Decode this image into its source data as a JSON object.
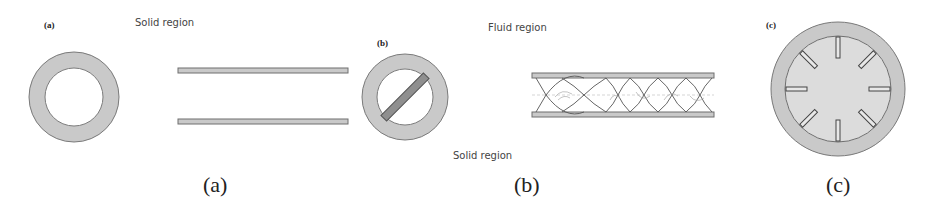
{
  "figure": {
    "colors": {
      "wall_fill": "#c9c9c9",
      "wall_stroke": "#7a7a7a",
      "tape_fill": "#8f8f8f",
      "fluid_fill_c": "#dcdcdc",
      "background": "#ffffff"
    },
    "panels": [
      {
        "id": "a",
        "tag": "(a)",
        "caption": "(a)",
        "region_label": "Solid region",
        "description": "Plain tube: annular cross-section and longitudinal view of two parallel walls"
      },
      {
        "id": "b",
        "tag": "(b)",
        "caption": "(b)",
        "region_label_top": "Fluid region",
        "region_label_bottom": "Solid region",
        "description": "Tube with twisted tape insert: cross-section with diagonal tape and longitudinal view with twisted tape pattern"
      },
      {
        "id": "c",
        "tag": "(c)",
        "caption": "(c)",
        "fin_count": 8,
        "description": "Tube with 8 internal radial fins, cross-section"
      }
    ]
  }
}
